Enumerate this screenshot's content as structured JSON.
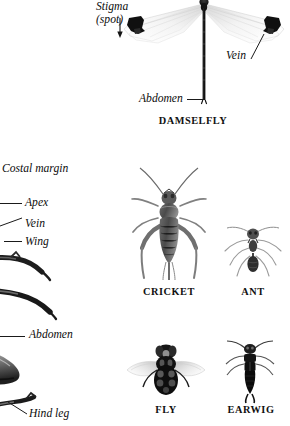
{
  "page": {
    "background": "#ffffff",
    "ink": "#111111",
    "width": 290,
    "height": 426
  },
  "body_text": {
    "lines": [
      "s and moths,",
      "eir life-cycle.",
      ", then to a"
    ]
  },
  "figures": [
    {
      "id": "damselfly",
      "caption": "DAMSELFLY",
      "labels": [
        {
          "id": "stigma",
          "text_line_1": "Stigma",
          "text_line_2": "(spot)"
        },
        {
          "id": "vein",
          "text": "Vein"
        },
        {
          "id": "abdomen",
          "text": "Abdomen"
        }
      ]
    },
    {
      "id": "wing-detail",
      "caption": "",
      "labels": [
        {
          "id": "costal-margin",
          "text": "Costal margin"
        },
        {
          "id": "apex",
          "text": "Apex"
        },
        {
          "id": "vein",
          "text": "Vein"
        },
        {
          "id": "wing",
          "text": "Wing"
        },
        {
          "id": "abdomen",
          "text": "Abdomen"
        },
        {
          "id": "hind-leg",
          "text": "Hind leg"
        }
      ]
    },
    {
      "id": "cricket",
      "caption": "CRICKET",
      "labels": []
    },
    {
      "id": "ant",
      "caption": "ANT",
      "labels": []
    },
    {
      "id": "fly",
      "caption": "FLY",
      "labels": []
    },
    {
      "id": "earwig",
      "caption": "EARWIG",
      "labels": []
    }
  ],
  "captions": {
    "damselfly": "DAMSELFLY",
    "cricket": "CRICKET",
    "ant": "ANT",
    "fly": "FLY",
    "earwig": "EARWIG"
  },
  "labels": {
    "stigma_line1": "Stigma",
    "stigma_line2": "(spot)",
    "vein_right": "Vein",
    "abdomen_damselfly": "Abdomen",
    "costal_margin": "Costal margin",
    "apex": "Apex",
    "vein_left": "Vein",
    "wing": "Wing",
    "abdomen_left": "Abdomen",
    "hind_leg": "Hind leg"
  }
}
